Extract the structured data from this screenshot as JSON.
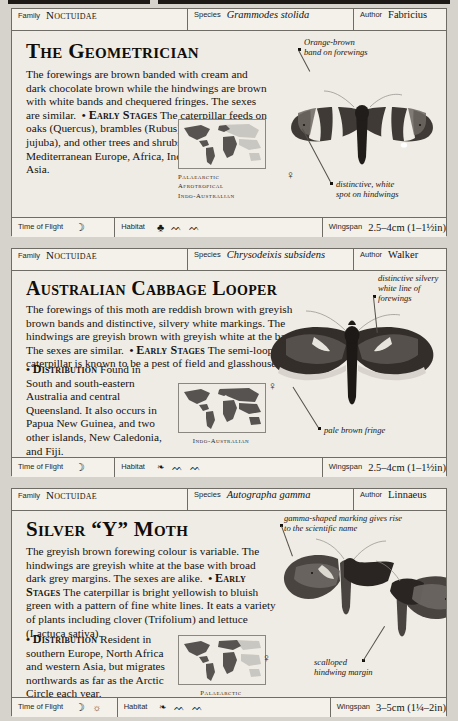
{
  "page": {
    "background": "#d6d3cd",
    "card_background": "#efece5",
    "rule_color": "#1c1916"
  },
  "field_labels": {
    "family": "Family",
    "species": "Species",
    "author": "Author",
    "time_of_flight": "Time of Flight",
    "habitat": "Habitat",
    "wingspan": "Wingspan"
  },
  "entries": [
    {
      "family": "Noctuidae",
      "species": "Grammodes stolida",
      "author": "Fabricius",
      "title": "The Geometrician",
      "description": "The forewings are brown banded with cream and dark chocolate brown while the hindwings are brown with white bands and chequered fringes. The sexes are similar.",
      "early_stages_label": "Early Stages",
      "early_stages": "The caterpillar feeds on oaks (Quercus), brambles (Rubus), jujuba (Zizyphus jujuba), and other trees and shrubs.",
      "distribution_label": "Distribution",
      "distribution": "Mediterranean Europe, Africa, India, and South-east Asia.",
      "map_regions": [
        "Palaearctic",
        "Afrotropical",
        "Indo-Australian"
      ],
      "time_of_flight_icons": [
        "moon-icon"
      ],
      "habitat_icons": [
        "tree-icon",
        "grass-icon",
        "grass-icon"
      ],
      "wingspan": "2.5–4cm (1–1½in)",
      "sex_symbol": "♀",
      "callouts": [
        "Orange-brown\nband on forewings",
        "distinctive, white\nspot on hindwings"
      ]
    },
    {
      "family": "Noctuidae",
      "species": "Chrysodeixis subsidens",
      "author": "Walker",
      "title": "Australian Cabbage Looper",
      "description": "The forewings of this moth are reddish brown with greyish brown bands and distinctive, silvery white markings. The hindwings are greyish brown with greyish white at the base. The sexes are similar.",
      "early_stages_label": "Early Stages",
      "early_stages": "The semi-looper caterpillar is known to be a pest of field and glasshouse crops.",
      "distribution_label": "Distribution",
      "distribution": "Found in South and south-eastern Australia and central Queensland. It also occurs in Papua New Guinea, and two other islands, New Caledonia, and Fiji.",
      "map_regions": [
        "Indo-Australian"
      ],
      "time_of_flight_icons": [
        "moon-icon"
      ],
      "habitat_icons": [
        "leaf-icon",
        "grass-icon",
        "grass-icon"
      ],
      "wingspan": "2.5–4cm (1–1½in)",
      "sex_symbol": "♀",
      "callouts": [
        "distinctive silvery\nwhite line of\nforewings",
        "pale brown fringe"
      ]
    },
    {
      "family": "Noctuidae",
      "species": "Autographa gamma",
      "author": "Linnaeus",
      "title": "Silver “Y” Moth",
      "description": "The greyish brown forewing colour is variable. The hindwings are greyish white at the base with broad dark grey margins. The sexes are alike.",
      "early_stages_label": "Early Stages",
      "early_stages": "The caterpillar is bright yellowish to bluish green with a pattern of fine white lines. It eats a variety of plants including clover (Trifolium) and lettuce (Lactuca sativa).",
      "distribution_label": "Distribution",
      "distribution": "Resident in southern Europe, North Africa and western Asia, but migrates northwards as far as the Arctic Circle each year.",
      "map_regions": [
        "Palaearctic"
      ],
      "time_of_flight_icons": [
        "moon-icon",
        "sun-icon"
      ],
      "habitat_icons": [
        "leaf-icon",
        "grass-icon",
        "grass-icon"
      ],
      "wingspan": "3–5cm (1¼–2in)",
      "sex_symbol": "♀",
      "callouts": [
        "gamma-shaped marking gives rise\nto the scientific name",
        "scalloped\nhindwing margin"
      ]
    }
  ],
  "icons": {
    "moon-icon": "☽",
    "sun-icon": "☼",
    "tree-icon": "♣",
    "leaf-icon": "❧",
    "grass-icon": "ᨓ"
  }
}
